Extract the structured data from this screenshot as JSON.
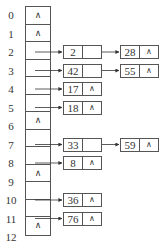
{
  "hash_table": {
    "indices": [
      "0",
      "1",
      "2",
      "3",
      "4",
      "5",
      "6",
      "7",
      "8",
      "9",
      "10",
      "11",
      "12"
    ],
    "null_symbol": "∧",
    "slots": [
      {
        "index": "0",
        "chain": []
      },
      {
        "index": "1",
        "chain": []
      },
      {
        "index": "2",
        "chain": [
          "2",
          "28"
        ]
      },
      {
        "index": "3",
        "chain": [
          "42",
          "55"
        ]
      },
      {
        "index": "4",
        "chain": [
          "17"
        ]
      },
      {
        "index": "5",
        "chain": [
          "18"
        ]
      },
      {
        "index": "6",
        "chain": []
      },
      {
        "index": "7",
        "chain": [
          "33",
          "59"
        ]
      },
      {
        "index": "8",
        "chain": [
          "8"
        ]
      },
      {
        "index": "9",
        "chain": []
      },
      {
        "index": "10",
        "chain": [
          "36"
        ]
      },
      {
        "index": "11",
        "chain": [
          "76"
        ]
      },
      {
        "index": "12",
        "chain": []
      }
    ]
  },
  "nodes": {
    "n2": "2",
    "n28": "28",
    "n42": "42",
    "n55": "55",
    "n17": "17",
    "n18": "18",
    "n33": "33",
    "n59": "59",
    "n8": "8",
    "n36": "36",
    "n76": "76"
  },
  "null": "∧"
}
